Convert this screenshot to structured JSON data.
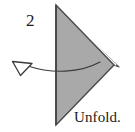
{
  "figure": {
    "step_number": "2",
    "caption": "Unfold.",
    "background_color": "#ffffff",
    "shape": {
      "name": "folded-triangle",
      "fill_color": "#a9a9a9",
      "edge_color": "#4a4a4a",
      "crease_highlight_color": "#ffffff",
      "points_right": true,
      "vertices": [
        {
          "x": 56,
          "y": 5
        },
        {
          "x": 114,
          "y": 65
        },
        {
          "x": 56,
          "y": 125
        }
      ],
      "underlayer_vertices": [
        {
          "x": 57,
          "y": 8
        },
        {
          "x": 118,
          "y": 67
        },
        {
          "x": 100,
          "y": 62
        }
      ]
    },
    "arrow": {
      "name": "unfold-arrow",
      "direction": "leftward",
      "head_style": "hollow-outline-triangle",
      "line_color": "#3a3a3a",
      "head_fill_color": "#ffffff",
      "start": {
        "x": 100,
        "y": 63
      },
      "end": {
        "x": 26,
        "y": 66
      },
      "head_tip": {
        "x": 17,
        "y": 73
      },
      "head_corners": [
        {
          "x": 13,
          "y": 62
        },
        {
          "x": 32,
          "y": 63
        },
        {
          "x": 21,
          "y": 75
        }
      ]
    }
  }
}
